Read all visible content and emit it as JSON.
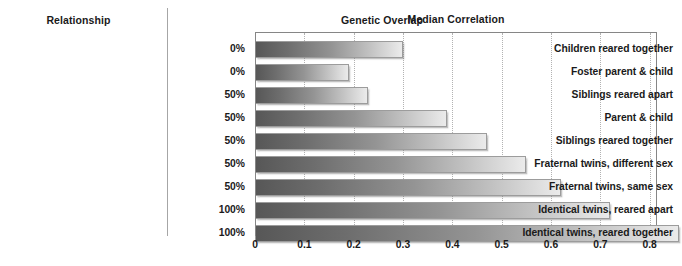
{
  "headers": {
    "relationship": "Relationship",
    "genetic_overlap": "Genetic Overlap",
    "chart_title": "Median Correlation"
  },
  "chart_data": {
    "type": "bar",
    "orientation": "horizontal",
    "title": "Median Correlation",
    "xlabel": "",
    "ylabel": "Relationship",
    "xlim": [
      0,
      0.9
    ],
    "xticks": [
      "0",
      "0.1",
      "0.2",
      "0.3",
      "0.4",
      "0.5",
      "0.6",
      "0.7",
      "0.8",
      "0.9"
    ],
    "xtick_values": [
      0,
      0.1,
      0.2,
      0.3,
      0.4,
      0.5,
      0.6,
      0.7,
      0.8,
      0.9
    ],
    "grid": true,
    "legend": "none",
    "categories": [
      "Children reared together",
      "Foster parent & child",
      "Siblings reared apart",
      "Parent & child",
      "Siblings reared together",
      "Fraternal twins, different sex",
      "Fraternal twins, same sex",
      "Identical twins, reared apart",
      "Identical twins, reared together"
    ],
    "values": [
      0.3,
      0.19,
      0.23,
      0.39,
      0.47,
      0.55,
      0.62,
      0.72,
      0.86
    ],
    "genetic_overlap": [
      "0%",
      "0%",
      "50%",
      "50%",
      "50%",
      "50%",
      "50%",
      "100%",
      "100%"
    ],
    "bar_gradient_start": "#575757",
    "bar_gradient_end": "#ebebeb",
    "bar_border_color": "#9c9c9c",
    "grid_color": "#b2b2b2",
    "frame_color": "#868686",
    "text_color": "#1a1a1a",
    "background": "#ffffff"
  }
}
